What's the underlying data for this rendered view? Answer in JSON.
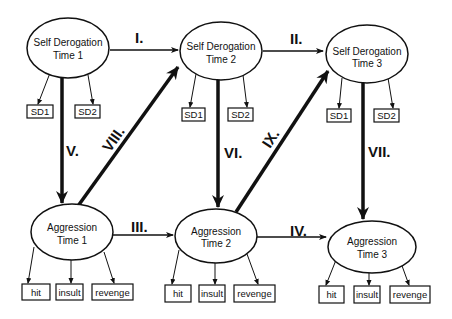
{
  "diagram": {
    "type": "cross-lagged panel model",
    "colors": {
      "stroke": "#111111",
      "background": "#ffffff"
    },
    "latent_nodes": [
      {
        "id": "sd1",
        "line1": "Self Derogation",
        "line2": "Time 1",
        "cx": 68,
        "cy": 48,
        "rx": 41,
        "ry": 30
      },
      {
        "id": "sd2",
        "line1": "Self Derogation",
        "line2": "Time 2",
        "cx": 221,
        "cy": 51,
        "rx": 41,
        "ry": 29
      },
      {
        "id": "sd3",
        "line1": "Self Derogation",
        "line2": "Time 3",
        "cx": 367,
        "cy": 54,
        "rx": 41,
        "ry": 29
      },
      {
        "id": "agg1",
        "line1": "Aggression",
        "line2": "Time 1",
        "cx": 72,
        "cy": 232,
        "rx": 41,
        "ry": 28
      },
      {
        "id": "agg2",
        "line1": "Aggression",
        "line2": "Time 2",
        "cx": 216,
        "cy": 236,
        "rx": 41,
        "ry": 27
      },
      {
        "id": "agg3",
        "line1": "Aggression",
        "line2": "Time 3",
        "cx": 372,
        "cy": 247,
        "rx": 44,
        "ry": 26
      }
    ],
    "indicators": [
      {
        "parent": "sd1",
        "label": "SD1",
        "x": 27,
        "y": 105,
        "w": 26,
        "h": 13
      },
      {
        "parent": "sd1",
        "label": "SD2",
        "x": 75,
        "y": 105,
        "w": 25,
        "h": 13
      },
      {
        "parent": "sd2",
        "label": "SD1",
        "x": 182,
        "y": 108,
        "w": 23,
        "h": 13
      },
      {
        "parent": "sd2",
        "label": "SD2",
        "x": 228,
        "y": 108,
        "w": 25,
        "h": 13
      },
      {
        "parent": "sd3",
        "label": "SD1",
        "x": 327,
        "y": 109,
        "w": 24,
        "h": 13
      },
      {
        "parent": "sd3",
        "label": "SD2",
        "x": 374,
        "y": 109,
        "w": 25,
        "h": 13
      },
      {
        "parent": "agg1",
        "label": "hit",
        "x": 22,
        "y": 284,
        "w": 28,
        "h": 16
      },
      {
        "parent": "agg1",
        "label": "insult",
        "x": 56,
        "y": 284,
        "w": 27,
        "h": 16
      },
      {
        "parent": "agg1",
        "label": "revenge",
        "x": 92,
        "y": 284,
        "w": 41,
        "h": 16
      },
      {
        "parent": "agg2",
        "label": "hit",
        "x": 165,
        "y": 285,
        "w": 26,
        "h": 17
      },
      {
        "parent": "agg2",
        "label": "insult",
        "x": 199,
        "y": 285,
        "w": 26,
        "h": 17
      },
      {
        "parent": "agg2",
        "label": "revenge",
        "x": 234,
        "y": 285,
        "w": 41,
        "h": 17
      },
      {
        "parent": "agg3",
        "label": "hit",
        "x": 319,
        "y": 286,
        "w": 25,
        "h": 17
      },
      {
        "parent": "agg3",
        "label": "insult",
        "x": 354,
        "y": 286,
        "w": 26,
        "h": 17
      },
      {
        "parent": "agg3",
        "label": "revenge",
        "x": 390,
        "y": 286,
        "w": 40,
        "h": 17
      }
    ],
    "paths": [
      {
        "label": "I.",
        "from": "sd1",
        "to": "sd2",
        "weight": "thin"
      },
      {
        "label": "II.",
        "from": "sd2",
        "to": "sd3",
        "weight": "thin"
      },
      {
        "label": "III.",
        "from": "agg1",
        "to": "agg2",
        "weight": "thin"
      },
      {
        "label": "IV.",
        "from": "agg2",
        "to": "agg3",
        "weight": "thin"
      },
      {
        "label": "V.",
        "from": "sd1",
        "to": "agg1",
        "weight": "thick"
      },
      {
        "label": "VI.",
        "from": "sd2",
        "to": "agg2",
        "weight": "thick"
      },
      {
        "label": "VII.",
        "from": "sd3",
        "to": "agg3",
        "weight": "thick"
      },
      {
        "label": "VIII.",
        "from": "agg1",
        "to": "sd2",
        "weight": "thick"
      },
      {
        "label": "IX.",
        "from": "agg2",
        "to": "sd3",
        "weight": "thick"
      }
    ]
  }
}
